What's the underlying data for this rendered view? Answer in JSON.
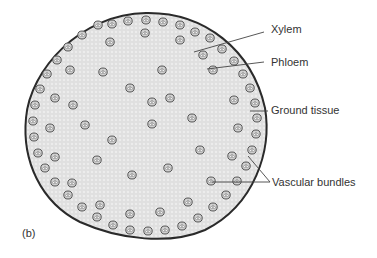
{
  "figure": {
    "panel_label": "(b)",
    "labels": [
      {
        "id": "xylem",
        "text": "Xylem"
      },
      {
        "id": "phloem",
        "text": "Phloem"
      },
      {
        "id": "ground-tissue",
        "text": "Ground tissue"
      },
      {
        "id": "vascular-bundles",
        "text": "Vascular bundles"
      }
    ]
  },
  "colors": {
    "outline": "#2a2a2a",
    "tissue": "#e6e6e6",
    "bundle": "#6a6a6a",
    "text": "#333333",
    "leader": "#444444"
  }
}
